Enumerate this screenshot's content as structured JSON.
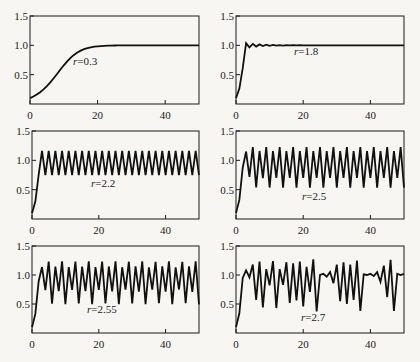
{
  "chart_data": [
    {
      "type": "line",
      "title": "",
      "annotation": "r=0.3",
      "r": 0.3,
      "x0": 0.1,
      "model": "x[t+1] = x[t] + r*x[t]*(1 - x[t])",
      "xlim": [
        0,
        50
      ],
      "ylim": [
        0,
        1.5
      ],
      "xticks": [
        "0",
        "20",
        "40"
      ],
      "yticks": [
        "0.5",
        "1.0",
        "1.5"
      ],
      "xlabel": "",
      "ylabel": "",
      "grid": false,
      "description": "Smooth monotone S-shaped rise from 0.1 to 1.0, settling by t≈20"
    },
    {
      "type": "line",
      "title": "",
      "annotation": "r=1.8",
      "r": 1.8,
      "x0": 0.1,
      "model": "x[t+1] = x[t] + r*x[t]*(1 - x[t])",
      "xlim": [
        0,
        50
      ],
      "ylim": [
        0,
        1.5
      ],
      "xticks": [
        "0",
        "20",
        "40"
      ],
      "yticks": [
        "0.5",
        "1.0",
        "1.5"
      ],
      "xlabel": "",
      "ylabel": "",
      "grid": false,
      "description": "Rapid rise then damped oscillation converging to 1.0 by t≈12"
    },
    {
      "type": "line",
      "title": "",
      "annotation": "r=2.2",
      "r": 2.2,
      "x0": 0.1,
      "model": "x[t+1] = x[t] + r*x[t]*(1 - x[t])",
      "xlim": [
        0,
        50
      ],
      "ylim": [
        0,
        1.5
      ],
      "xticks": [
        "0",
        "20",
        "40"
      ],
      "yticks": [
        "0.5",
        "1.0",
        "1.5"
      ],
      "xlabel": "",
      "ylabel": "",
      "grid": false,
      "description": "Period-2 oscillation between ~0.75 and ~1.15"
    },
    {
      "type": "line",
      "title": "",
      "annotation": "r=2.5",
      "r": 2.5,
      "x0": 0.1,
      "model": "x[t+1] = x[t] + r*x[t]*(1 - x[t])",
      "xlim": [
        0,
        50
      ],
      "ylim": [
        0,
        1.5
      ],
      "xticks": [
        "0",
        "20",
        "40"
      ],
      "yticks": [
        "0.5",
        "1.0",
        "1.5"
      ],
      "xlabel": "",
      "ylabel": "",
      "grid": false,
      "description": "Period-4 oscillation with values ~0.54, ~1.16, ~0.70, ~1.22"
    },
    {
      "type": "line",
      "title": "",
      "annotation": "r=2.55",
      "r": 2.55,
      "x0": 0.1,
      "model": "x[t+1] = x[t] + r*x[t]*(1 - x[t])",
      "xlim": [
        0,
        50
      ],
      "ylim": [
        0,
        1.5
      ],
      "xticks": [
        "0",
        "20",
        "40"
      ],
      "yticks": [
        "0.5",
        "1.0",
        "1.5"
      ],
      "xlabel": "",
      "ylabel": "",
      "grid": false,
      "description": "Period-8 oscillation between ~0.5 and ~1.23"
    },
    {
      "type": "line",
      "title": "",
      "annotation": "r=2.7",
      "r": 2.7,
      "x0": 0.1,
      "model": "x[t+1] = x[t] + r*x[t]*(1 - x[t])",
      "xlim": [
        0,
        50
      ],
      "ylim": [
        0,
        1.5
      ],
      "xticks": [
        "0",
        "20",
        "40"
      ],
      "yticks": [
        "0.5",
        "1.0",
        "1.5"
      ],
      "xlabel": "",
      "ylabel": "",
      "grid": false,
      "description": "Chaotic, irregular oscillation between ~0.38 and ~1.27",
      "x": [
        0,
        1,
        2,
        3,
        4,
        5,
        6,
        7,
        8,
        9,
        10,
        11,
        12,
        13,
        14,
        15,
        16,
        17,
        18,
        19,
        20,
        21,
        22,
        23,
        24,
        25,
        26,
        27,
        28,
        29,
        30,
        31,
        32,
        33,
        34,
        35,
        36,
        37,
        38,
        39,
        40,
        41,
        42,
        43,
        44,
        45,
        46,
        47,
        48,
        49,
        50
      ],
      "values": [
        0.1,
        0.34,
        0.95,
        1.08,
        0.96,
        1.18,
        0.57,
        1.23,
        0.44,
        1.1,
        0.82,
        1.24,
        0.43,
        1.1,
        0.83,
        1.22,
        0.52,
        1.2,
        0.56,
        1.23,
        0.46,
        1.14,
        0.71,
        1.27,
        0.37,
        1.0,
        1.02,
        0.97,
        1.05,
        0.86,
        1.18,
        0.55,
        1.22,
        0.5,
        1.18,
        0.57,
        1.25,
        0.38,
        1.01,
        1.0,
        1.02,
        0.98,
        1.05,
        0.88,
        1.16,
        0.62,
        1.26,
        0.38,
        1.02,
        1.0,
        1.02
      ]
    }
  ]
}
